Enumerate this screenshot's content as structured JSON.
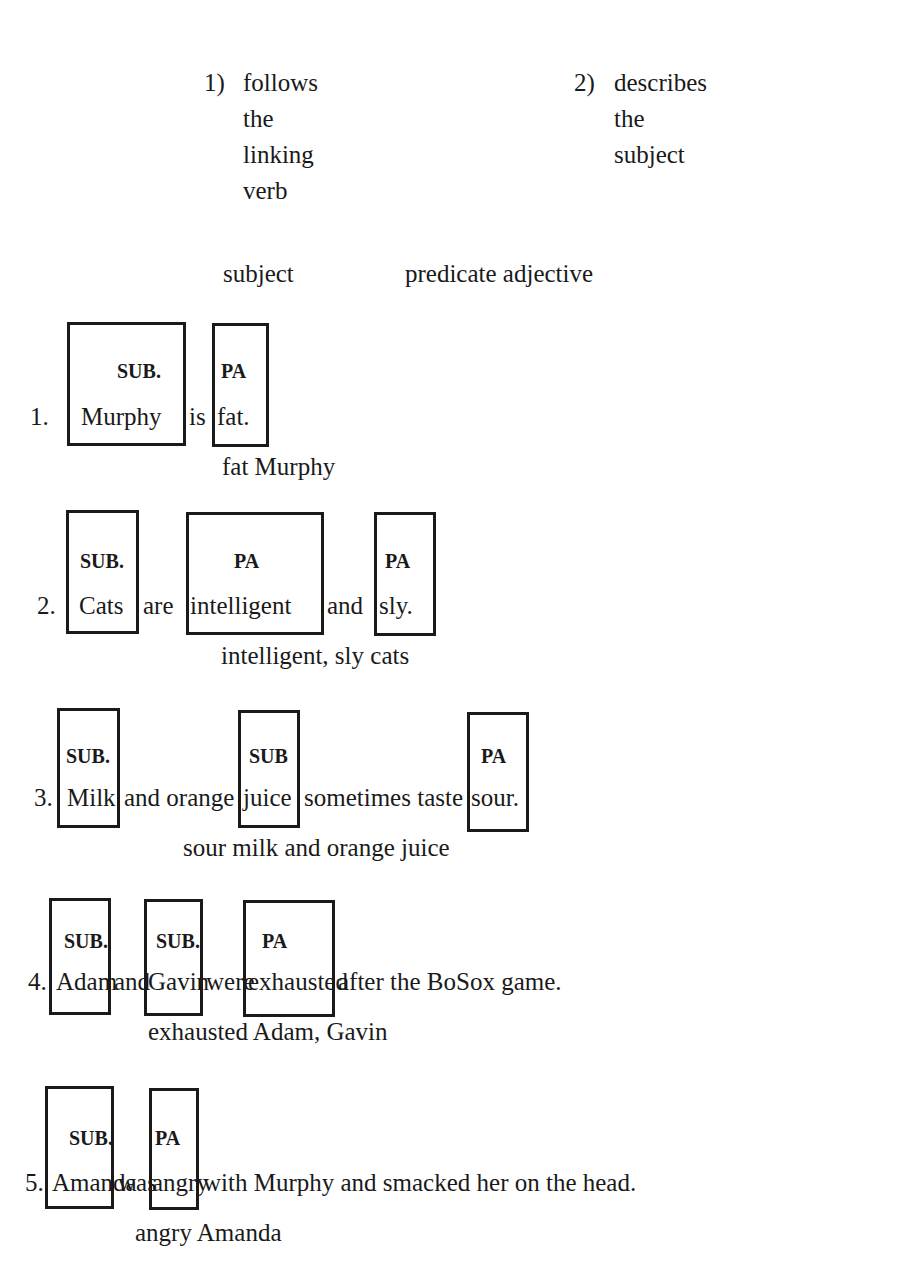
{
  "criteria": [
    {
      "number": "1)",
      "lines": [
        "follows",
        "the",
        "linking",
        "verb"
      ]
    },
    {
      "number": "2)",
      "lines": [
        "describes",
        "the",
        "subject"
      ]
    }
  ],
  "headings": {
    "subject": "subject",
    "predicate_adjective": "predicate adjective"
  },
  "sentences": [
    {
      "num": "1.",
      "words": [
        "Murphy",
        "is",
        "fat."
      ],
      "labels": [
        "SUB.",
        "PA"
      ],
      "answer": "fat Murphy"
    },
    {
      "num": "2.",
      "words": [
        "Cats",
        "are",
        "intelligent",
        "and",
        "sly."
      ],
      "labels": [
        "SUB.",
        "PA",
        "PA"
      ],
      "answer": "intelligent, sly cats"
    },
    {
      "num": "3.",
      "words": [
        "Milk",
        "and orange",
        "juice",
        "sometimes taste",
        "sour."
      ],
      "labels": [
        "SUB.",
        "SUB",
        "PA"
      ],
      "answer": "sour milk and orange juice"
    },
    {
      "num": "4.",
      "words": [
        "Adam",
        "and",
        "Gavin",
        "were",
        "exhausted",
        "after the BoSox game."
      ],
      "labels": [
        "SUB.",
        "SUB.",
        "PA"
      ],
      "answer": "exhausted Adam, Gavin"
    },
    {
      "num": "5.",
      "words": [
        "Amanda",
        "was",
        "angry",
        "with Murphy and smacked her on the head."
      ],
      "labels": [
        "SUB.",
        "PA"
      ],
      "answer": "angry Amanda"
    }
  ]
}
